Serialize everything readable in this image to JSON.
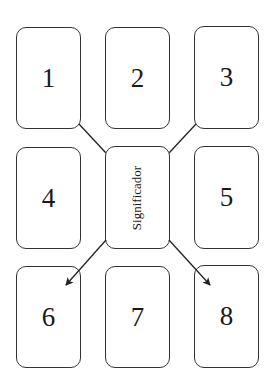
{
  "diagram": {
    "cards": [
      {
        "id": "1",
        "label": "1",
        "x": 16,
        "y": 27,
        "w": 65,
        "h": 102
      },
      {
        "id": "2",
        "label": "2",
        "x": 105,
        "y": 27,
        "w": 65,
        "h": 102
      },
      {
        "id": "3",
        "label": "3",
        "x": 194,
        "y": 26,
        "w": 65,
        "h": 103
      },
      {
        "id": "4",
        "label": "4",
        "x": 16,
        "y": 147,
        "w": 65,
        "h": 102
      },
      {
        "id": "center",
        "label": "Significador",
        "x": 105,
        "y": 146,
        "w": 65,
        "h": 103
      },
      {
        "id": "5",
        "label": "5",
        "x": 194,
        "y": 146,
        "w": 65,
        "h": 103
      },
      {
        "id": "6",
        "label": "6",
        "x": 16,
        "y": 266,
        "w": 65,
        "h": 102
      },
      {
        "id": "7",
        "label": "7",
        "x": 105,
        "y": 266,
        "w": 65,
        "h": 102
      },
      {
        "id": "8",
        "label": "8",
        "x": 194,
        "y": 265,
        "w": 65,
        "h": 103
      }
    ],
    "connectors": [
      {
        "from": "1",
        "to": "center",
        "arrow": false
      },
      {
        "from": "3",
        "to": "center",
        "arrow": false
      },
      {
        "from": "center",
        "to": "6",
        "arrow": true
      },
      {
        "from": "center",
        "to": "8",
        "arrow": true
      }
    ],
    "colors": {
      "stroke": "#333333",
      "background": "#ffffff"
    }
  }
}
